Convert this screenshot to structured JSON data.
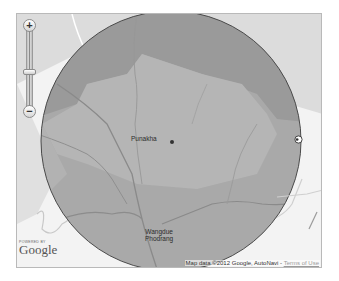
{
  "map": {
    "labels": {
      "punakha": "Punakha",
      "wangdue": "Wangdue\nPhodrang"
    },
    "zoom_in_label": "+",
    "zoom_out_label": "−",
    "powered_by": "POWERED BY",
    "logo": "Google",
    "attribution": {
      "text": "Map data ©2012 Google, AutoNavi",
      "separator": " - ",
      "terms_label": "Terms of Use"
    },
    "colors": {
      "background": "#f3f3f3",
      "circle_fill": "#a9a9a9",
      "circle_stroke": "#4a4a4a",
      "region_dark": "#9a9a9a",
      "region_light": "#c5c5c5",
      "rivers": "#8c8c8c"
    }
  }
}
